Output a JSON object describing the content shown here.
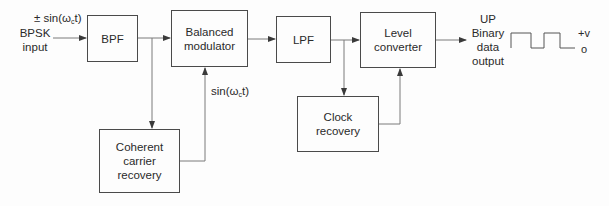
{
  "diagram": {
    "input": {
      "signal": "± sin(ω",
      "signal_sub": "c",
      "signal_tail": "t)",
      "name_line1": "BPSK",
      "name_line2": "input"
    },
    "blocks": {
      "bpf": "BPF",
      "balanced_modulator_line1": "Balanced",
      "balanced_modulator_line2": "modulator",
      "lpf": "LPF",
      "level_converter_line1": "Level",
      "level_converter_line2": "converter",
      "carrier_recovery_line1": "Coherent",
      "carrier_recovery_line2": "carrier",
      "carrier_recovery_line3": "recovery",
      "clock_recovery_line1": "Clock",
      "clock_recovery_line2": "recovery"
    },
    "carrier_label": {
      "text": "sin(ω",
      "sub": "c",
      "tail": "t)"
    },
    "output": {
      "line1": "UP",
      "line2": "Binary",
      "line3": "data",
      "line4": "output"
    },
    "waveform": {
      "high_label": "+v",
      "low_label": "o"
    },
    "colors": {
      "line": "#6a6a6a",
      "block_border": "#4a4a4a",
      "text": "#2a2a2a"
    }
  }
}
